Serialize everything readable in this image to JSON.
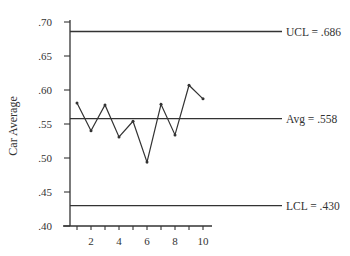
{
  "chart_data": {
    "type": "line",
    "title": "",
    "xlabel": "",
    "ylabel": "Car Average",
    "x": [
      1,
      2,
      3,
      4,
      5,
      6,
      7,
      8,
      9,
      10
    ],
    "series": [
      {
        "name": "Car Average",
        "values": [
          0.581,
          0.54,
          0.578,
          0.531,
          0.554,
          0.494,
          0.579,
          0.534,
          0.607,
          0.587
        ]
      }
    ],
    "reference_lines": [
      {
        "name": "UCL",
        "value": 0.686,
        "label": "UCL = .686"
      },
      {
        "name": "Avg",
        "value": 0.558,
        "label": "Avg = .558"
      },
      {
        "name": "LCL",
        "value": 0.43,
        "label": "LCL = .430"
      }
    ],
    "ylim": [
      0.4,
      0.7
    ],
    "xlim": [
      0.5,
      10.5
    ],
    "y_ticks": [
      ".40",
      ".45",
      ".50",
      ".55",
      ".60",
      ".65",
      ".70"
    ],
    "y_tick_values": [
      0.4,
      0.45,
      0.5,
      0.55,
      0.6,
      0.65,
      0.7
    ],
    "x_tick_labels": [
      "2",
      "4",
      "6",
      "8",
      "10"
    ],
    "x_tick_label_values": [
      2,
      4,
      6,
      8,
      10
    ],
    "x_minor_ticks": [
      1,
      2,
      3,
      4,
      5,
      6,
      7,
      8,
      9,
      10
    ],
    "grid": false,
    "legend": "none"
  },
  "colors": {
    "line": "#333333",
    "axis": "#333333",
    "text": "#333333",
    "background": "#ffffff"
  }
}
